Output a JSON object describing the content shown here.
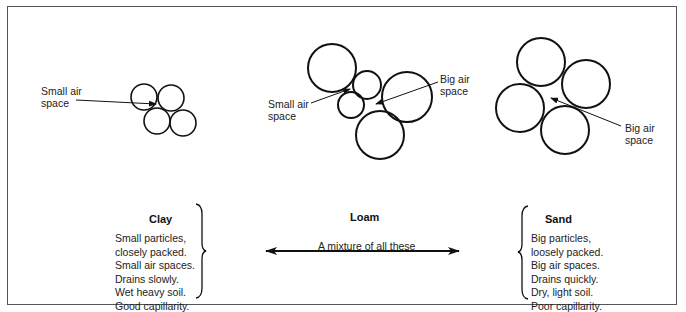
{
  "diagram": {
    "clay": {
      "title": "Clay",
      "label": "Small air\nspace",
      "properties": [
        "Small particles,",
        "closely packed.",
        "Small air spaces.",
        "Drains slowly.",
        "Wet heavy soil.",
        "Good capillarity."
      ],
      "circles": [
        {
          "cx": 144,
          "cy": 97,
          "r": 13
        },
        {
          "cx": 171,
          "cy": 98,
          "r": 13
        },
        {
          "cx": 157,
          "cy": 121,
          "r": 13
        },
        {
          "cx": 183,
          "cy": 123,
          "r": 13
        }
      ]
    },
    "loam": {
      "title": "Loam",
      "small_label": "Small air\nspace",
      "big_label": "Big air\nspace",
      "description": "A mixture of all these",
      "circles": [
        {
          "cx": 332,
          "cy": 68,
          "r": 24
        },
        {
          "cx": 367,
          "cy": 85,
          "r": 14
        },
        {
          "cx": 407,
          "cy": 97,
          "r": 25
        },
        {
          "cx": 351,
          "cy": 105,
          "r": 13
        },
        {
          "cx": 380,
          "cy": 135,
          "r": 24
        }
      ]
    },
    "sand": {
      "title": "Sand",
      "label": "Big air\nspace",
      "properties": [
        "Big particles,",
        "loosely packed.",
        "Big air spaces.",
        "Drains quickly.",
        "Dry, light soil.",
        "Poor capillarity."
      ],
      "circles": [
        {
          "cx": 541,
          "cy": 62,
          "r": 24
        },
        {
          "cx": 586,
          "cy": 84,
          "r": 24
        },
        {
          "cx": 520,
          "cy": 108,
          "r": 24
        },
        {
          "cx": 565,
          "cy": 130,
          "r": 24
        }
      ]
    }
  }
}
